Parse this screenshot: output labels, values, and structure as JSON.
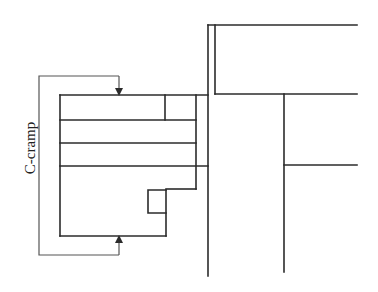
{
  "diagram": {
    "type": "technical-sketch",
    "labels": {
      "cramp": "C-cramp"
    },
    "colors": {
      "line": "#2b2b2b",
      "background": "#ffffff"
    },
    "parts": [
      {
        "name": "c-cramp-frame",
        "description": "C-shaped clamp with arrows on jaws"
      },
      {
        "name": "board-stack",
        "description": "Stacked boards with stepped notch at bottom"
      },
      {
        "name": "upright-post",
        "description": "Double vertical member"
      },
      {
        "name": "right-frame",
        "description": "Framing to the right with horizontal members"
      }
    ]
  }
}
